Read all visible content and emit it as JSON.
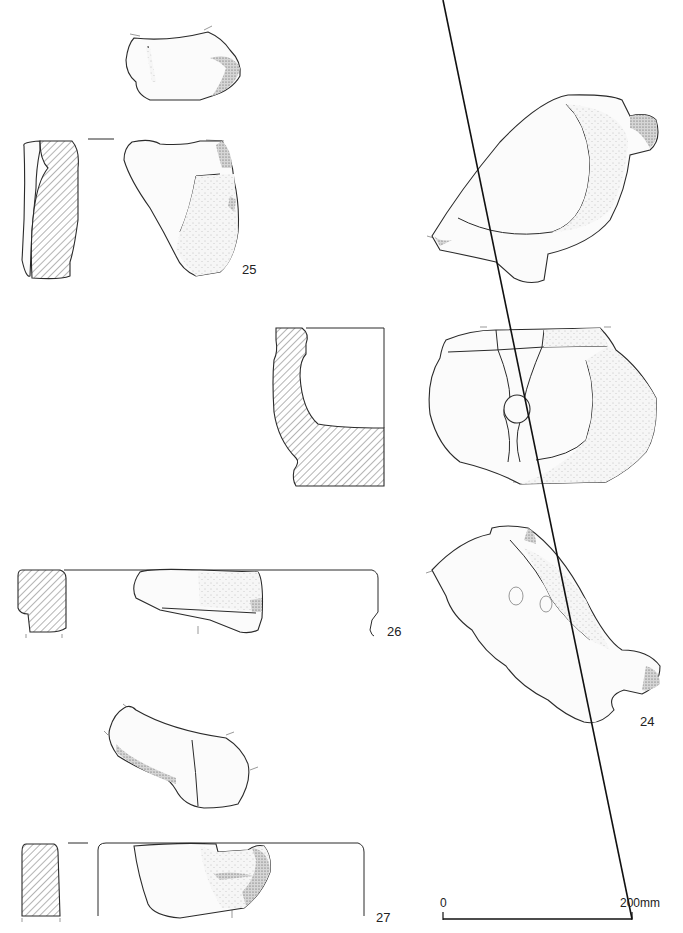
{
  "plate": {
    "title": "Archaeological stone fragment drawings",
    "objects": [
      {
        "id": "25",
        "label": "25",
        "views": [
          "top-view",
          "section",
          "front-view"
        ]
      },
      {
        "id": "26",
        "label": "26",
        "views": [
          "section",
          "front-view",
          "profile-outline"
        ]
      },
      {
        "id": "27",
        "label": "27",
        "views": [
          "top-view",
          "section",
          "front-view",
          "profile-outline"
        ]
      },
      {
        "id": "24",
        "label": "24",
        "views": [
          "top-view",
          "section",
          "front-view",
          "oblique-view"
        ]
      }
    ]
  },
  "scale_bar": {
    "start_label": "0",
    "end_label": "200mm"
  },
  "colors": {
    "line": "#2a2a2a",
    "background": "#ffffff"
  }
}
